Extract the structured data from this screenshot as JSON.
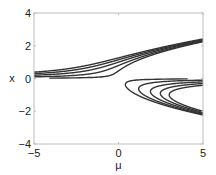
{
  "chart_data": {
    "type": "line",
    "title": "",
    "xlabel": "μ",
    "ylabel": "x",
    "xlim": [
      -5,
      5
    ],
    "ylim": [
      -4,
      4
    ],
    "xticks": [
      -5,
      0,
      5
    ],
    "yticks": [
      -4,
      -2,
      0,
      2,
      4
    ],
    "xtick_labels": [
      "−5",
      "0",
      "5"
    ],
    "ytick_labels": [
      "−4",
      "−2",
      "0",
      "2",
      "4"
    ],
    "grid": false,
    "legend": null,
    "series": [
      {
        "name": "h=0.1",
        "h": 0.1,
        "upper_branch_at_mu_-5": 0.02,
        "upper_branch_at_mu_5": 2.24,
        "lower_fold_mu": 0.41
      },
      {
        "name": "h=0.5",
        "h": 0.5,
        "upper_branch_at_mu_-5": 0.1,
        "upper_branch_at_mu_5": 2.29,
        "lower_fold_mu": 1.19
      },
      {
        "name": "h=1",
        "h": 1.0,
        "upper_branch_at_mu_-5": 0.2,
        "upper_branch_at_mu_5": 2.33,
        "lower_fold_mu": 1.89
      },
      {
        "name": "h=1.5",
        "h": 1.5,
        "upper_branch_at_mu_-5": 0.29,
        "upper_branch_at_mu_5": 2.37,
        "lower_fold_mu": 2.48
      },
      {
        "name": "h=2",
        "h": 2.0,
        "upper_branch_at_mu_-5": 0.38,
        "upper_branch_at_mu_5": 2.41,
        "lower_fold_mu": 3.0
      }
    ],
    "h_values": [
      0.1,
      0.5,
      1.0,
      1.5,
      2.0
    ]
  },
  "layout": {
    "plot_left": 34,
    "plot_top": 13,
    "plot_right": 203,
    "plot_bottom": 144
  }
}
